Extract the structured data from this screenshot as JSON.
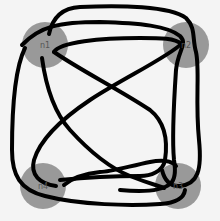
{
  "diagram": {
    "type": "graph",
    "background": "#f4f4f4",
    "node_color": "#999999",
    "edge_color": "#000000",
    "nodes": [
      {
        "id": "n1",
        "label": "n1",
        "cx": 45,
        "cy": 45,
        "r": 23
      },
      {
        "id": "n2",
        "label": "n2",
        "cx": 186,
        "cy": 45,
        "r": 23
      },
      {
        "id": "n3",
        "label": "n3",
        "cx": 178,
        "cy": 186,
        "r": 23
      },
      {
        "id": "n4",
        "label": "n4",
        "cx": 43,
        "cy": 186,
        "r": 23
      }
    ],
    "edges": [
      {
        "id": "e1",
        "from": "n1",
        "to": "n3",
        "d": "M49,34 C52,20 60,8 80,7 C120,5 170,6 186,18 C196,28 192,38 196,52 C200,70 195,100 199,140 C202,170 198,184 180,186 C168,187 164,178 162,170"
      },
      {
        "id": "e2",
        "from": "n1",
        "to": "n3",
        "d": "M22,45 C40,26 60,22 100,22 C140,23 168,26 180,36 C188,44 178,50 176,70 C174,100 172,140 174,160 C176,172 175,180 170,184 C160,192 140,192 120,190"
      },
      {
        "id": "e3",
        "from": "n1",
        "to": "n4",
        "d": "M54,52 C60,42 100,38 140,38 C160,38 176,38 181,44 C170,56 120,80 90,100 C60,120 40,140 34,160 C30,175 40,184 56,186"
      },
      {
        "id": "e4",
        "from": "n1",
        "to": "n3",
        "d": "M25,48 C14,70 12,110 12,150 C12,175 20,190 45,196 C80,205 130,206 160,204 C175,203 184,198 185,190"
      },
      {
        "id": "e5",
        "from": "n1",
        "to": "n3",
        "d": "M42,58 C45,80 52,110 70,130 C90,152 110,168 130,176 C150,184 160,186 164,188"
      },
      {
        "id": "e6",
        "from": "n1",
        "to": "n4",
        "d": "M54,52 C80,70 120,90 150,110 C165,122 168,140 165,160 C163,172 150,176 140,176 C110,176 80,178 60,180"
      },
      {
        "id": "e7",
        "from": "n3",
        "to": "n4",
        "d": "M176,166 C172,160 160,160 150,162 C130,166 110,172 100,172 C80,174 70,180 64,185"
      }
    ]
  }
}
